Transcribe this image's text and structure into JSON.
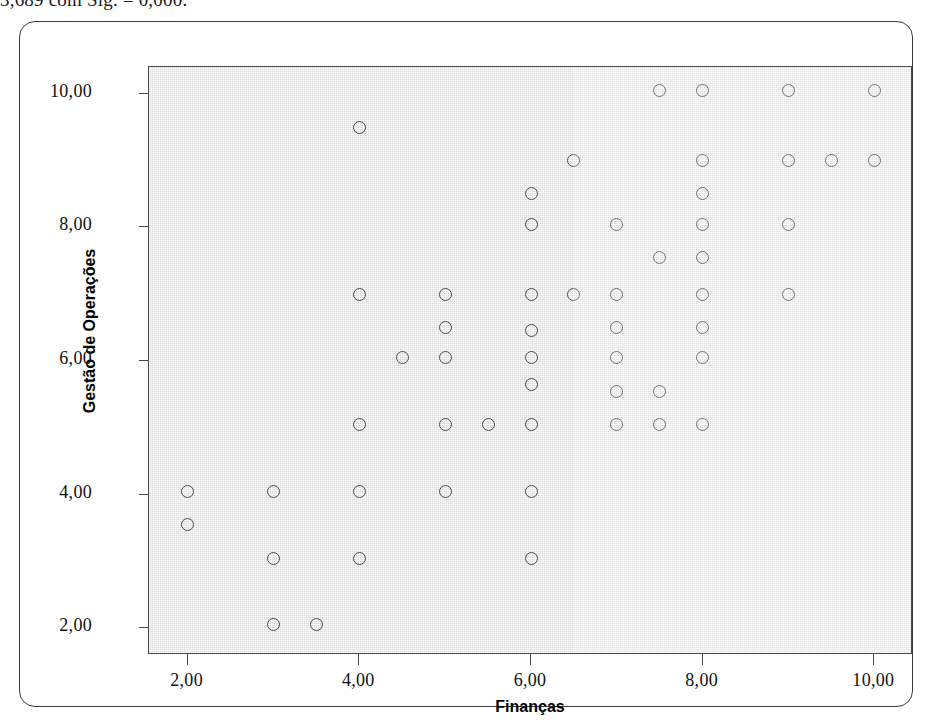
{
  "caption_clipped": "3,689 com Sig. = 0,000.",
  "figure": {
    "x_axis": {
      "title": "Finanças",
      "ticks": [
        "2,00",
        "4,00",
        "6,00",
        "8,00",
        "10,00"
      ],
      "tick_values": [
        2,
        4,
        6,
        8,
        10
      ],
      "range": [
        1.55,
        10.45
      ]
    },
    "y_axis": {
      "title": "Gestão de Operações",
      "ticks": [
        "2,00",
        "4,00",
        "6,00",
        "8,00",
        "10,00"
      ],
      "tick_values": [
        2,
        4,
        6,
        8,
        10
      ],
      "range": [
        1.6,
        10.4
      ]
    },
    "marker": {
      "shape": "open-circle",
      "edge_color": "#4c4c4c",
      "fill": "none",
      "size_px": 13
    },
    "panel_color": "#e3e3e3",
    "frame_color": "#4a4a4a"
  },
  "chart_data": {
    "type": "scatter",
    "title": "",
    "xlabel": "Finanças",
    "ylabel": "Gestão de Operações",
    "xlim": [
      1.55,
      10.45
    ],
    "ylim": [
      1.6,
      10.4
    ],
    "grid": false,
    "legend": null,
    "series": [
      {
        "name": "Alunos",
        "marker": "o",
        "color": "#4c4c4c",
        "points": [
          [
            2.0,
            4.05
          ],
          [
            2.0,
            3.55
          ],
          [
            3.0,
            4.05
          ],
          [
            3.0,
            3.05
          ],
          [
            3.0,
            2.05
          ],
          [
            3.5,
            2.05
          ],
          [
            4.0,
            9.5
          ],
          [
            4.0,
            7.0
          ],
          [
            4.0,
            5.05
          ],
          [
            4.0,
            4.05
          ],
          [
            4.0,
            3.05
          ],
          [
            4.5,
            6.05
          ],
          [
            5.0,
            7.0
          ],
          [
            5.0,
            6.5
          ],
          [
            5.0,
            6.05
          ],
          [
            5.0,
            5.05
          ],
          [
            5.0,
            4.05
          ],
          [
            5.5,
            5.05
          ],
          [
            6.0,
            8.5
          ],
          [
            6.0,
            8.05
          ],
          [
            6.0,
            7.0
          ],
          [
            6.0,
            6.45
          ],
          [
            6.0,
            6.05
          ],
          [
            6.0,
            5.65
          ],
          [
            6.0,
            5.05
          ],
          [
            6.0,
            4.05
          ],
          [
            6.0,
            3.05
          ],
          [
            6.5,
            9.0
          ],
          [
            6.5,
            7.0
          ],
          [
            7.0,
            8.05
          ],
          [
            7.0,
            7.0
          ],
          [
            7.0,
            6.5
          ],
          [
            7.0,
            6.05
          ],
          [
            7.0,
            5.55
          ],
          [
            7.0,
            5.05
          ],
          [
            7.5,
            10.05
          ],
          [
            7.5,
            7.55
          ],
          [
            7.5,
            5.55
          ],
          [
            7.5,
            5.05
          ],
          [
            8.0,
            10.05
          ],
          [
            8.0,
            9.0
          ],
          [
            8.0,
            8.5
          ],
          [
            8.0,
            8.05
          ],
          [
            8.0,
            7.55
          ],
          [
            8.0,
            7.0
          ],
          [
            8.0,
            6.5
          ],
          [
            8.0,
            6.05
          ],
          [
            8.0,
            5.05
          ],
          [
            9.0,
            10.05
          ],
          [
            9.0,
            9.0
          ],
          [
            9.0,
            8.05
          ],
          [
            9.0,
            7.0
          ],
          [
            9.5,
            9.0
          ],
          [
            10.0,
            10.05
          ],
          [
            10.0,
            9.0
          ]
        ]
      }
    ],
    "n_points": 56
  }
}
